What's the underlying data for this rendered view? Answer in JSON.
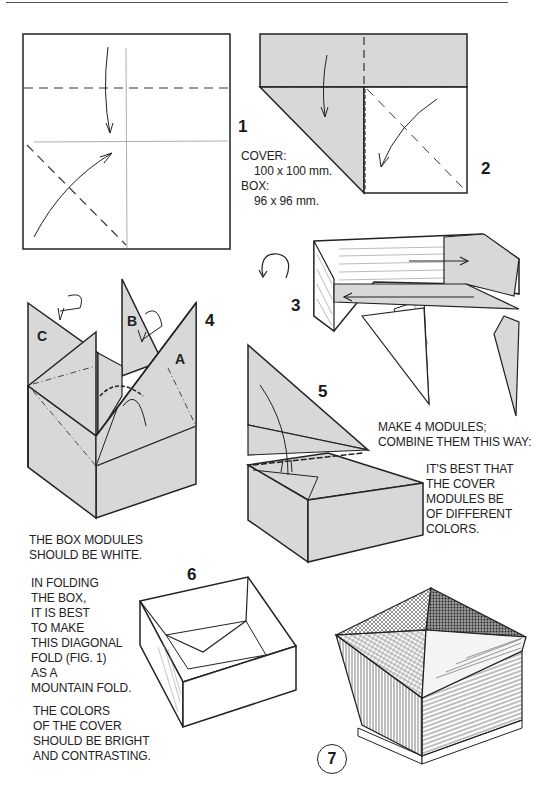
{
  "page": {
    "type": "origami-instructions",
    "fill_color": "#d8d8d8"
  },
  "figures": [
    {
      "number": "1",
      "description": "Square sheet with horizontal valley fold line near top, center vertical and horizontal creases, and diagonal fold in lower-left quadrant"
    },
    {
      "number": "2",
      "description": "Top strip folded down, left corner folded to diagonal, diagonal crease with curved arrow"
    },
    {
      "number": "3",
      "description": "Module shaped, turn over arrow, arrows indicating slide in/out"
    },
    {
      "number": "4",
      "description": "Four modules combined into square; flaps labeled",
      "labels": [
        "A",
        "B",
        "C"
      ]
    },
    {
      "number": "5",
      "description": "Flap folded down inside to lock the box"
    },
    {
      "number": "6",
      "description": "Completed open box"
    },
    {
      "number": "7",
      "description": "Finished box with pyramidal cover of four colors"
    }
  ],
  "notes": {
    "sizes": {
      "cover_label": "COVER:",
      "cover_size": "100 x 100 mm.",
      "box_label": "BOX:",
      "box_size": "96 x 96 mm."
    },
    "make_modules": [
      "MAKE 4 MODULES;",
      "COMBINE THEM THIS WAY:"
    ],
    "cover_colors": [
      "IT'S BEST THAT",
      "THE COVER",
      "MODULES BE",
      "OF DIFFERENT",
      "COLORS."
    ],
    "box_white": [
      "THE BOX MODULES",
      "SHOULD BE WHITE."
    ],
    "folding_box": [
      "IN FOLDING",
      "THE BOX,",
      "IT IS BEST",
      "TO MAKE",
      "THIS DIAGONAL",
      "FOLD (FIG. 1)",
      "AS A",
      "MOUNTAIN FOLD."
    ],
    "bright_colors": [
      "THE COLORS",
      "OF THE COVER",
      "SHOULD BE BRIGHT",
      "AND CONTRASTING."
    ]
  }
}
